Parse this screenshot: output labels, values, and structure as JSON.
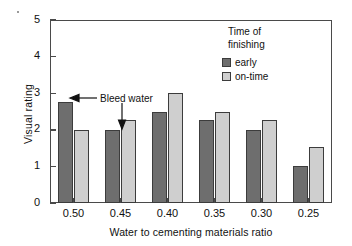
{
  "chart_data": {
    "type": "bar",
    "title": "",
    "xlabel": "Water to cementing materials ratio",
    "ylabel": "Visual rating",
    "categories": [
      "0.50",
      "0.45",
      "0.40",
      "0.35",
      "0.30",
      "0.25"
    ],
    "series": [
      {
        "name": "early",
        "color": "#6e6e6e",
        "values": [
          2.75,
          2.0,
          2.5,
          2.27,
          2.0,
          1.0
        ]
      },
      {
        "name": "on-time",
        "color": "#cfcfcf",
        "values": [
          2.0,
          2.27,
          3.0,
          2.5,
          2.27,
          1.52
        ]
      }
    ],
    "ylim": [
      0,
      5
    ],
    "yticks": [
      "0",
      "1",
      "2",
      "3",
      "4",
      "5"
    ],
    "grid": false,
    "legend": {
      "position": "top-right",
      "title_line1": "Time of",
      "title_line2": "finishing",
      "entries": [
        "early",
        "on-time"
      ]
    },
    "annotations": [
      {
        "text": "Bleed water",
        "targets": [
          "0.50 early bar top",
          "0.45 early bar top"
        ]
      }
    ]
  },
  "axis": {
    "ylabel": "Visual rating",
    "xlabel": "Water to cementing materials ratio"
  },
  "colors": {
    "early": "#6e6e6e",
    "on_time": "#cfcfcf",
    "frame": "#4a4a4a",
    "bar_edge": "#3c3c3c",
    "text": "#111111"
  }
}
